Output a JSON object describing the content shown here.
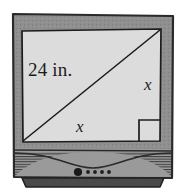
{
  "figure": {
    "screen_shape": "rectangle",
    "labels": {
      "diagonal": "24 in.",
      "side_right": "x",
      "side_bottom": "x"
    },
    "markers": {
      "right_angle": "right-angle-square"
    },
    "controls": {
      "power_button": "●",
      "indicator_dots_count": 4
    },
    "colors": {
      "screen_fill": "#dcdcdc",
      "bezel_fill": "#8f8f8f",
      "bezel_outline": "#2a2a2a",
      "grille_fill": "#9a9a9a",
      "grille_line": "#3a3a3a",
      "base_fill": "#4a4a4a",
      "line_color": "#1c1c1c",
      "page_background": "#ffffff"
    }
  }
}
